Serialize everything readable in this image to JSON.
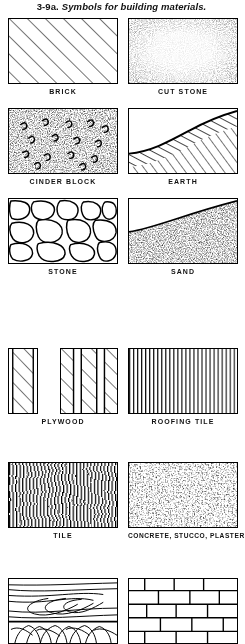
{
  "figure": {
    "number": "3-9a.",
    "caption": "Symbols for building materials."
  },
  "symbols": [
    {
      "label": "BRICK",
      "pattern": "diagonal-hatch-45"
    },
    {
      "label": "CUT STONE",
      "pattern": "stipple-dense-edges"
    },
    {
      "label": "CINDER BLOCK",
      "pattern": "stipple-with-hooks"
    },
    {
      "label": "EARTH",
      "pattern": "curved-bank-hatched"
    },
    {
      "label": "STONE",
      "pattern": "irregular-rubble"
    },
    {
      "label": "SAND",
      "pattern": "diagonal-edge-stipple"
    },
    {
      "label": "PLYWOOD",
      "pattern": "plies-diagonal-hatch"
    },
    {
      "label": "ROOFING TILE",
      "pattern": "vertical-ruled-fine"
    },
    {
      "label": "TILE",
      "pattern": "vertical-wavy-dense"
    },
    {
      "label": "CONCRETE, STUCCO, PLASTER",
      "pattern": "stipple-aggregate"
    },
    {
      "label": "",
      "pattern": "wood-grain"
    },
    {
      "label": "",
      "pattern": "running-bond-block"
    }
  ]
}
